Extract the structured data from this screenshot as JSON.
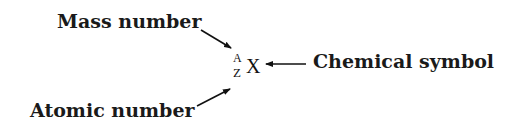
{
  "diagram": {
    "symbol": {
      "mass_number": "A",
      "atomic_number": "Z",
      "element": "X"
    },
    "labels": {
      "mass_number": "Mass number",
      "atomic_number": "Atomic number",
      "chemical_symbol": "Chemical symbol"
    },
    "colors": {
      "text": "#1a1a1a",
      "background": "#ffffff"
    }
  }
}
